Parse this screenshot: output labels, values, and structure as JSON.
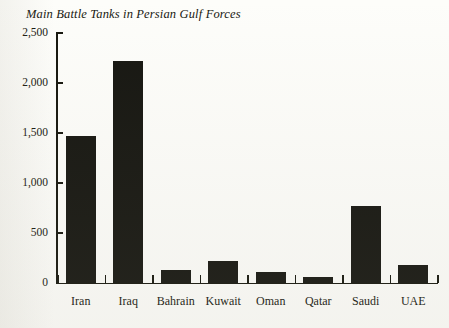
{
  "chart_data": {
    "type": "bar",
    "title": "Main Battle Tanks in Persian Gulf Forces",
    "xlabel": "",
    "ylabel": "",
    "categories": [
      "Iran",
      "Iraq",
      "Bahrain",
      "Kuwait",
      "Oman",
      "Qatar",
      "Saudi",
      "UAE"
    ],
    "values": [
      1470,
      2220,
      130,
      220,
      110,
      60,
      770,
      180
    ],
    "ylim": [
      0,
      2500
    ],
    "yticks": [
      0,
      500,
      1000,
      1500,
      2000,
      2500
    ],
    "ytick_labels": [
      "0",
      "500",
      "1,000",
      "1,500",
      "2,000",
      "2,500"
    ],
    "grid": false,
    "legend": false,
    "bar_color": "#171712",
    "series": [
      {
        "name": "Main Battle Tanks",
        "values": [
          1470,
          2220,
          130,
          220,
          110,
          60,
          770,
          180
        ]
      }
    ]
  }
}
